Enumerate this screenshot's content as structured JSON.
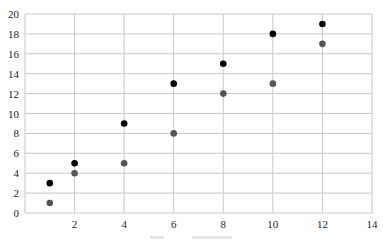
{
  "chart_data": {
    "type": "scatter",
    "title": "",
    "xlabel": "",
    "ylabel": "",
    "xlim": [
      0,
      14
    ],
    "ylim": [
      0,
      20
    ],
    "grid": true,
    "legend": null,
    "x_ticks": [
      2,
      4,
      6,
      8,
      10,
      12,
      14
    ],
    "y_ticks": [
      0,
      2,
      4,
      6,
      8,
      10,
      12,
      14,
      16,
      18,
      20
    ],
    "series": [
      {
        "name": "series-1",
        "color": "#000000",
        "points": [
          [
            1,
            3
          ],
          [
            2,
            5
          ],
          [
            4,
            9
          ],
          [
            6,
            13
          ],
          [
            8,
            15
          ],
          [
            10,
            18
          ],
          [
            12,
            19
          ]
        ]
      },
      {
        "name": "series-2",
        "color": "#555555",
        "points": [
          [
            1,
            1
          ],
          [
            2,
            4
          ],
          [
            4,
            5
          ],
          [
            6,
            8
          ],
          [
            8,
            12
          ],
          [
            10,
            13
          ],
          [
            12,
            17
          ]
        ]
      }
    ]
  },
  "colors": {
    "grid": "#c8c8c8",
    "axis": "#aaaaaa"
  }
}
